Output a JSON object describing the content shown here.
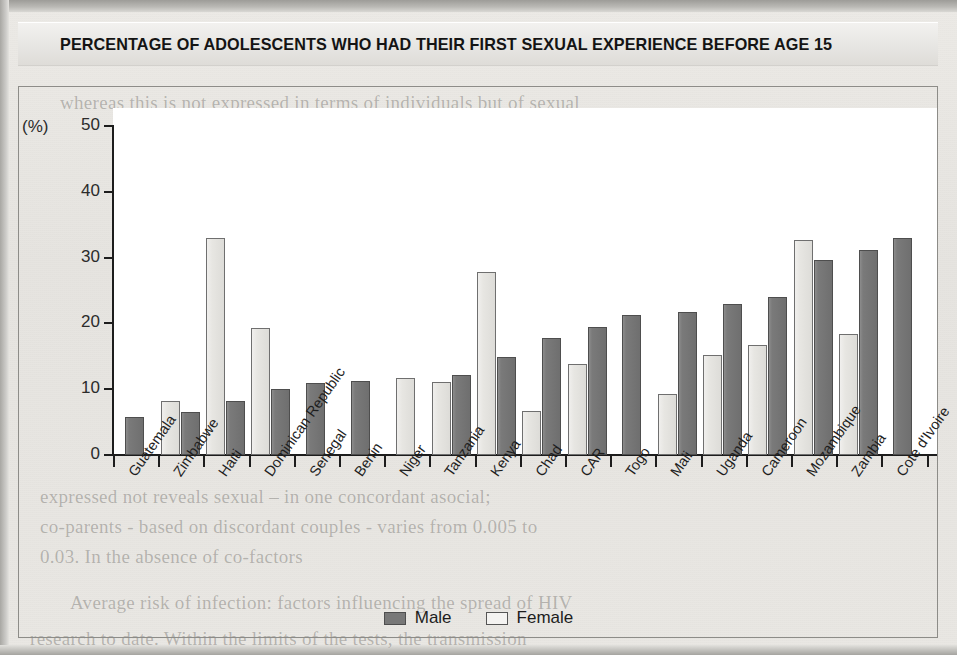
{
  "title": "PERCENTAGE OF ADOLESCENTS WHO HAD THEIR FIRST SEXUAL EXPERIENCE BEFORE AGE 15",
  "axis": {
    "y_unit_label": "(%)",
    "y_ticks": [
      "50",
      "40",
      "30",
      "20",
      "10",
      "0"
    ]
  },
  "legend": {
    "items": [
      {
        "label": "Male",
        "swatch": "male-swatch",
        "color": "#787878"
      },
      {
        "label": "Female",
        "swatch": "female-swatch",
        "color": "#f4f3f1"
      }
    ]
  },
  "background_text": {
    "line1": "whereas this is not expressed in terms of individuals but of sexual",
    "line2": "expressed not reveals sexual – in one concordant asocial;",
    "line3": "co-parents - based on discordant couples - varies from 0.005 to",
    "line4": "0.03. In the absence of co-factors",
    "line5": "Average risk of infection: factors influencing the spread of HIV",
    "line6": "research to date. Within the limits of the tests, the transmission"
  },
  "chart_data": {
    "type": "bar",
    "title": "PERCENTAGE OF ADOLESCENTS WHO HAD THEIR FIRST SEXUAL EXPERIENCE BEFORE AGE 15",
    "xlabel": "",
    "ylabel": "(%)",
    "ylim": [
      0,
      50
    ],
    "yticks": [
      0,
      10,
      20,
      30,
      40,
      50
    ],
    "grid": false,
    "legend_position": "bottom-center",
    "categories": [
      "Guatemala",
      "Zimbabwe",
      "Haiti",
      "Dominican Republic",
      "Senegal",
      "Benin",
      "Niger",
      "Tanzania",
      "Kenya",
      "Chad",
      "CAR",
      "Togo",
      "Mali",
      "Uganda",
      "Cameroon",
      "Mozambique",
      "Zambia",
      "Cote d'Ivoire"
    ],
    "series": [
      {
        "name": "Female",
        "color": "#e7e6e2",
        "values": [
          null,
          8.2,
          33.0,
          19.3,
          null,
          null,
          11.7,
          11.1,
          27.8,
          6.7,
          13.8,
          null,
          9.2,
          15.2,
          16.7,
          32.7,
          18.4,
          null
        ]
      },
      {
        "name": "Male",
        "color": "#787878",
        "values": [
          5.8,
          6.5,
          8.2,
          10.0,
          10.9,
          11.2,
          null,
          12.2,
          14.9,
          17.8,
          19.5,
          21.3,
          21.8,
          23.0,
          24.0,
          29.6,
          31.1,
          33.0
        ]
      }
    ]
  }
}
